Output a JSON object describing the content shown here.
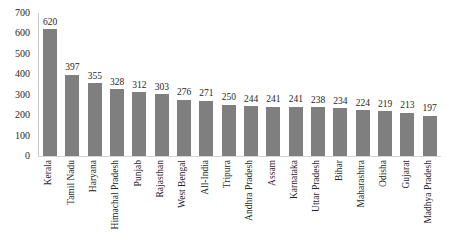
{
  "chart_data": {
    "type": "bar",
    "categories": [
      "Kerala",
      "Tamil Nadu",
      "Haryana",
      "Himachal Pradesh",
      "Punjab",
      "Rajasthan",
      "West Bengal",
      "All-India",
      "Tripura",
      "Andhra Pradesh",
      "Assam",
      "Karnataka",
      "Uttar Pradesh",
      "Bihar",
      "Maharashtra",
      "Odisha",
      "Gujarat",
      "Madhya Pradesh"
    ],
    "values": [
      620,
      397,
      355,
      328,
      312,
      303,
      276,
      271,
      250,
      244,
      241,
      241,
      238,
      234,
      224,
      219,
      213,
      197
    ],
    "yticks": [
      0,
      100,
      200,
      300,
      400,
      500,
      600,
      700
    ],
    "ylim": [
      0,
      700
    ],
    "data_labels": true,
    "grid": false,
    "legend": "none",
    "bar_color": "#7f7f7f",
    "text_color": "#262626",
    "axis_color": "#d6d6d6"
  }
}
